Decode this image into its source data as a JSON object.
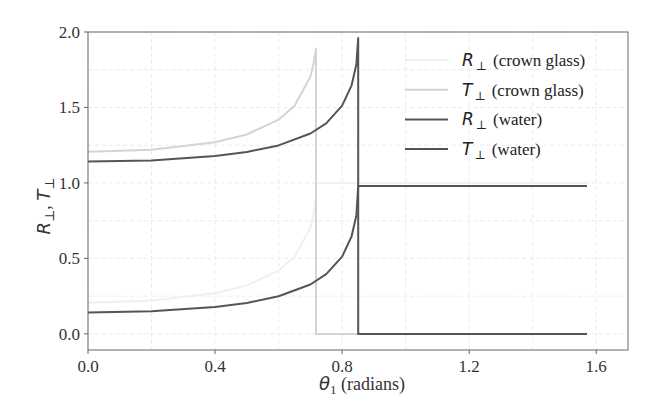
{
  "chart_data": {
    "type": "line",
    "title": "",
    "xlabel": "θ1 (radians)",
    "xlabel_symbol": "θ",
    "xlabel_sub": "1",
    "xlabel_rest": " (radians)",
    "ylabel": "R⊥, T⊥",
    "xlim": [
      0.0,
      1.7
    ],
    "ylim": [
      -0.107,
      2.0
    ],
    "xticks": [
      0.0,
      0.4,
      0.8,
      1.2,
      1.6
    ],
    "xtick_labels": [
      "0.0",
      "0.4",
      "0.8",
      "1.2",
      "1.6"
    ],
    "yticks": [
      0.0,
      0.5,
      1.0,
      1.5,
      2.0
    ],
    "ytick_labels": [
      "0.0",
      "0.5",
      "1.0",
      "1.5",
      "2.0"
    ],
    "grid": true,
    "legend_position": "top-right",
    "series": [
      {
        "name": "R⊥ (crown glass)",
        "symbol": "R",
        "label_rest": "(crown glass)",
        "color": "#f0f0f0",
        "x": [
          0.0,
          0.2,
          0.4,
          0.5,
          0.6,
          0.65,
          0.7,
          0.71,
          0.7178,
          0.7178,
          1.5708
        ],
        "y": [
          0.206,
          0.22,
          0.269,
          0.321,
          0.419,
          0.511,
          0.703,
          0.789,
          0.89,
          1.0,
          1.0
        ]
      },
      {
        "name": "T⊥ (crown glass)",
        "symbol": "T",
        "label_rest": "(crown glass)",
        "color": "#d4d4d4",
        "x": [
          0.0,
          0.2,
          0.4,
          0.5,
          0.6,
          0.65,
          0.7,
          0.71,
          0.7178,
          0.7178,
          1.5708
        ],
        "y": [
          1.206,
          1.22,
          1.269,
          1.321,
          1.419,
          1.511,
          1.703,
          1.789,
          1.89,
          0.0,
          0.0
        ]
      },
      {
        "name": "R⊥ (water)",
        "symbol": "R",
        "label_rest": "(water)",
        "color": "#555555",
        "x": [
          0.0,
          0.2,
          0.4,
          0.5,
          0.6,
          0.7,
          0.75,
          0.8,
          0.83,
          0.845,
          0.8505,
          0.8505,
          1.5708
        ],
        "y": [
          0.1416,
          0.1495,
          0.1777,
          0.2048,
          0.2487,
          0.3272,
          0.395,
          0.5115,
          0.6466,
          0.786,
          0.98,
          0.98,
          0.98
        ]
      },
      {
        "name": "T⊥ (water)",
        "symbol": "T",
        "label_rest": "(water)",
        "color": "#555555",
        "x": [
          0.0,
          0.2,
          0.4,
          0.5,
          0.6,
          0.7,
          0.75,
          0.8,
          0.83,
          0.845,
          0.8505,
          0.8505,
          1.5708
        ],
        "y": [
          1.1416,
          1.1495,
          1.1777,
          1.2048,
          1.2487,
          1.3272,
          1.395,
          1.5115,
          1.6466,
          1.786,
          1.96,
          0.0,
          0.0
        ]
      }
    ]
  }
}
